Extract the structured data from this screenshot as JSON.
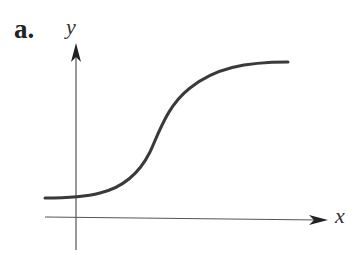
{
  "figure": {
    "panel_label": "a.",
    "x_axis_label": "x",
    "y_axis_label": "y",
    "curve": "sigmoid (logistic) curve rising from a low positive asymptote to a higher horizontal asymptote",
    "colors": {
      "curve": "#3a3a3a",
      "axes": "#555555"
    }
  }
}
